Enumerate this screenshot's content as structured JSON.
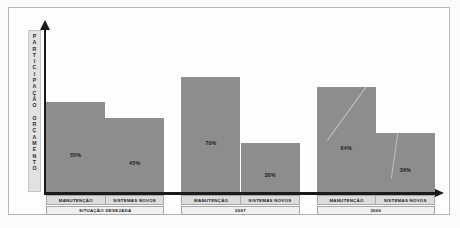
{
  "chart_data": {
    "type": "bar",
    "title": "",
    "xlabel": "",
    "ylabel": "PARTICIPAÇÃO ORÇAMENTO",
    "ylim": [
      0,
      100
    ],
    "grid": false,
    "legend": "none",
    "axis_arrows": true,
    "value_suffix": "%",
    "groups": [
      {
        "group_label": "SITUAÇÃO DESEJADA",
        "categories": [
          "MANUTENÇÃO",
          "SISTEMAS NOVOS"
        ],
        "values": [
          55,
          45
        ],
        "value_labels": [
          "55%",
          "45%"
        ]
      },
      {
        "group_label": "2007",
        "categories": [
          "MANUTENÇÃO",
          "SISTEMAS NOVOS"
        ],
        "values": [
          70,
          30
        ],
        "value_labels": [
          "70%",
          "30%"
        ]
      },
      {
        "group_label": "2006",
        "categories": [
          "MANUTENÇÃO",
          "SISTEMAS NOVOS"
        ],
        "values": [
          64,
          36
        ],
        "value_labels": [
          "64%",
          "36%"
        ]
      }
    ],
    "colors": {
      "bar_fill": "#8d8d8d",
      "axis": "#1a1a1a",
      "label_box": "#dcdcdc",
      "group_box": "#efefef",
      "frame": "#b9b9b9",
      "background": "#fdfdfd"
    }
  },
  "y_axis_letters": [
    "P",
    "A",
    "R",
    "T",
    "I",
    "C",
    "I",
    "P",
    "A",
    "Ç",
    "Ã",
    "O",
    "",
    "O",
    "R",
    "Ç",
    "A",
    "M",
    "E",
    "N",
    "T",
    "O"
  ]
}
